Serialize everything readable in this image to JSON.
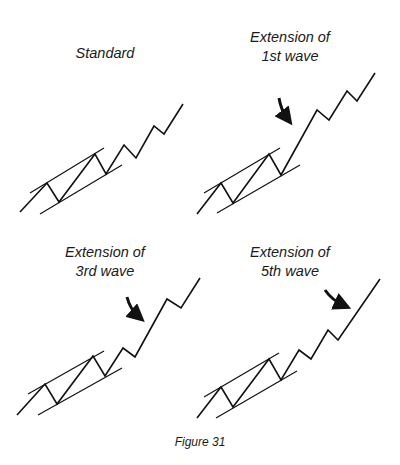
{
  "figure": {
    "caption": "Figure 31",
    "panels": [
      {
        "id": "standard",
        "title_line1": "Standard",
        "title_line2": "",
        "wave_points": "20,212 47,183 59,202 95,154 106,174 124,145 136,158 154,126 164,134 183,104",
        "upper_channel": "30,193 104,148",
        "lower_channel": "40,214 122,165",
        "arrow": null
      },
      {
        "id": "extension-1st-wave",
        "title_line1": "Extension of",
        "title_line2": "1st wave",
        "wave_points": "197,214 221,183 233,203 269,154 281,175 317,110 329,120 347,91 357,101 375,73",
        "upper_channel": "204,193 280,148",
        "lower_channel": "217,213 300,165",
        "arrow": "M279,98 Q281,110 287,118"
      },
      {
        "id": "extension-3rd-wave",
        "title_line1": "Extension of",
        "title_line2": "3rd wave",
        "wave_points": "17,415 45,384 57,404 93,356 105,376 123,348 135,357 167,299 181,308 200,278",
        "upper_channel": "28,394 104,351",
        "lower_channel": "38,415 122,368",
        "arrow": "M127,297 Q130,309 138,316"
      },
      {
        "id": "extension-5th-wave",
        "title_line1": "Extension of",
        "title_line2": "5th wave",
        "wave_points": "197,418 221,387 233,407 269,359 281,380 299,350 311,359 328,330 338,340 380,279",
        "upper_channel": "204,397 279,353",
        "lower_channel": "216,418 297,371",
        "arrow": "M325,290 Q332,300 343,305"
      }
    ]
  }
}
